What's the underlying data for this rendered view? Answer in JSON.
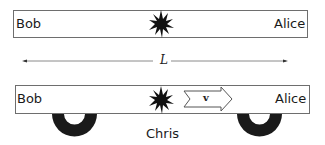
{
  "diagram": {
    "top_train": {
      "left_label": "Bob",
      "right_label": "Alice",
      "center_icon": "flash-burst-icon"
    },
    "length_marker": {
      "label": "L",
      "style": "double-headed-arrow"
    },
    "bottom_train": {
      "left_label": "Bob",
      "right_label": "Alice",
      "center_icon": "flash-burst-icon",
      "velocity_arrow_label": "v",
      "velocity_direction": "right",
      "wheels": [
        "left-wheel",
        "right-wheel"
      ]
    },
    "observer_label": "Chris",
    "colors": {
      "line": "#6e6e6e",
      "fill_dark": "#1a1a1a",
      "background": "#ffffff"
    }
  }
}
